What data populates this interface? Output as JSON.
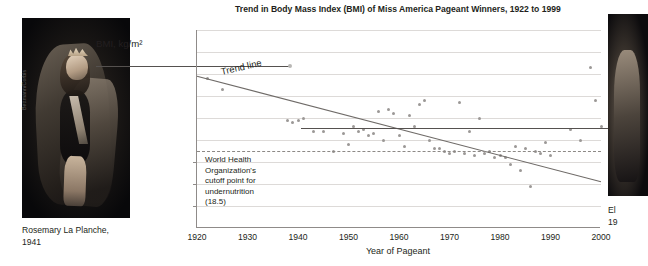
{
  "figure": {
    "left_photo": {
      "credit": "Bettmann/Corbis",
      "caption": "Rosemary La Planche,\n1941",
      "caption_line1": "Rosemary La Planche,",
      "caption_line2": "1941",
      "alt": "black-and-white photograph of a 1941 Miss America pageant winner in cape and crown"
    },
    "right_photo": {
      "caption_line1": "El",
      "caption_line2": "19",
      "alt": "partially cropped black-and-white photograph of a later pageant winner"
    },
    "y_axis_label": "BMI, kg/m²"
  },
  "chart_data": {
    "type": "scatter",
    "title": "Trend in Body Mass Index (BMI) of Miss America Pageant Winners, 1922 to 1999",
    "xlabel": "Year of Pageant",
    "ylabel": "BMI, kg/m²",
    "xlim": [
      1920,
      2000
    ],
    "ylim": [
      15,
      24
    ],
    "xticks": [
      1920,
      1930,
      1940,
      1950,
      1960,
      1970,
      1980,
      1990,
      2000
    ],
    "yticks": [
      15,
      16,
      17,
      18,
      19,
      20,
      21,
      22,
      23,
      24
    ],
    "grid": "horizontal",
    "legend": "none",
    "series": [
      {
        "name": "Miss America Pageant Winners",
        "marker": "small gray dot",
        "color": "#9b9896",
        "points": [
          [
            1922,
            21.8
          ],
          [
            1925,
            21.3
          ],
          [
            1938,
            19.9
          ],
          [
            1939,
            19.8
          ],
          [
            1940,
            19.9
          ],
          [
            1941,
            20.0
          ],
          [
            1943,
            19.4
          ],
          [
            1945,
            19.4
          ],
          [
            1947,
            18.5
          ],
          [
            1949,
            19.3
          ],
          [
            1950,
            18.8
          ],
          [
            1951,
            19.6
          ],
          [
            1952,
            19.4
          ],
          [
            1953,
            19.5
          ],
          [
            1954,
            19.2
          ],
          [
            1955,
            19.3
          ],
          [
            1956,
            20.3
          ],
          [
            1957,
            19.0
          ],
          [
            1958,
            20.4
          ],
          [
            1959,
            20.2
          ],
          [
            1960,
            19.2
          ],
          [
            1961,
            18.7
          ],
          [
            1962,
            20.1
          ],
          [
            1963,
            19.6
          ],
          [
            1964,
            20.6
          ],
          [
            1965,
            20.8
          ],
          [
            1966,
            19.0
          ],
          [
            1967,
            18.6
          ],
          [
            1968,
            18.6
          ],
          [
            1969,
            18.5
          ],
          [
            1970,
            18.4
          ],
          [
            1971,
            18.5
          ],
          [
            1972,
            20.7
          ],
          [
            1973,
            18.4
          ],
          [
            1974,
            19.4
          ],
          [
            1975,
            18.3
          ],
          [
            1976,
            20.0
          ],
          [
            1977,
            18.4
          ],
          [
            1978,
            18.5
          ],
          [
            1979,
            18.2
          ],
          [
            1980,
            18.3
          ],
          [
            1981,
            18.2
          ],
          [
            1982,
            17.9
          ],
          [
            1983,
            18.7
          ],
          [
            1984,
            17.6
          ],
          [
            1985,
            18.6
          ],
          [
            1986,
            16.9
          ],
          [
            1987,
            18.5
          ],
          [
            1988,
            18.4
          ],
          [
            1989,
            18.9
          ],
          [
            1990,
            18.3
          ],
          [
            1994,
            19.5
          ],
          [
            1996,
            19.0
          ],
          [
            1998,
            22.3
          ],
          [
            1999,
            20.8
          ],
          [
            2000,
            19.6
          ]
        ]
      }
    ],
    "trend_line": {
      "label": "Trend line",
      "x": [
        1920,
        2000
      ],
      "y": [
        21.9,
        17.1
      ],
      "color": "#6f6b68"
    },
    "reference_line": {
      "label": "World Health Organization's cutoff point for undernutrition (18.5)",
      "value": 18.5,
      "style": "dashed",
      "color": "#8d8986",
      "annotation_lines": [
        "World Health",
        "Organization's",
        "cutoff point for",
        "undernutrition",
        "(18.5)"
      ]
    }
  }
}
